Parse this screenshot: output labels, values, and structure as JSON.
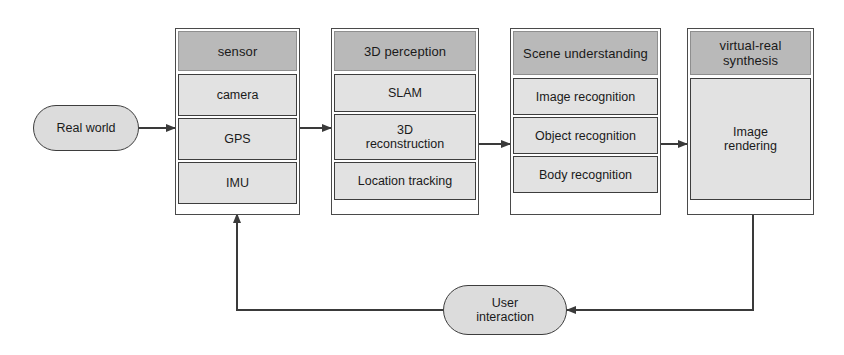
{
  "diagram": {
    "colors": {
      "header_fill": "#b9b9b9",
      "item_fill": "#e2e2e2",
      "pill_fill": "#dcdcdc",
      "stroke": "#3d3d3d",
      "background": "#ffffff"
    },
    "input_node": {
      "label": "Real world",
      "shape": "rounded-rectangle"
    },
    "feedback_node": {
      "label": "User\ninteraction",
      "shape": "rounded-rectangle"
    },
    "stages": [
      {
        "header": "sensor",
        "items": [
          "camera",
          "GPS",
          "IMU"
        ]
      },
      {
        "header": "3D perception",
        "items": [
          "SLAM",
          "3D\nreconstruction",
          "Location tracking"
        ]
      },
      {
        "header": "Scene\nunderstanding",
        "items": [
          "Image recognition",
          "Object recognition",
          "Body recognition"
        ]
      },
      {
        "header": "virtual-real\nsynthesis",
        "items": [
          "Image\nrendering"
        ]
      }
    ],
    "connections": [
      {
        "from": "Real world",
        "to": "sensor",
        "type": "arrow"
      },
      {
        "from": "sensor",
        "to": "3D perception",
        "type": "arrow"
      },
      {
        "from": "3D perception",
        "to": "Scene understanding",
        "type": "arrow"
      },
      {
        "from": "Scene understanding",
        "to": "virtual-real synthesis",
        "type": "arrow"
      },
      {
        "from": "virtual-real synthesis",
        "to": "User interaction",
        "type": "arrow"
      },
      {
        "from": "User interaction",
        "to": "sensor",
        "type": "arrow"
      }
    ]
  }
}
